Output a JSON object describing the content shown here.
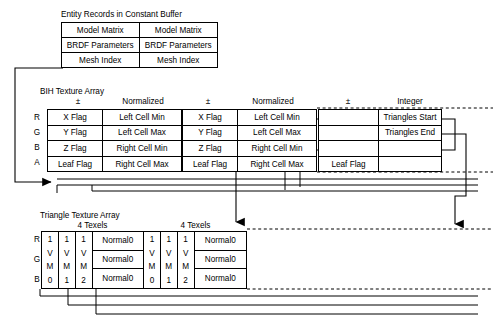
{
  "diagram": {
    "title_entity": "Entity Records in Constant Buffer",
    "title_bih": "BIH Texture Array",
    "title_tri": "Triangle Texture Array"
  },
  "entity_records": {
    "rows": [
      [
        "Model Matrix",
        "Model Matrix"
      ],
      [
        "BRDF Parameters",
        "BRDF Parameters"
      ],
      [
        "Mesh Index",
        "Mesh Index"
      ]
    ]
  },
  "bih": {
    "row_labels": [
      "R",
      "G",
      "B",
      "A"
    ],
    "headers": [
      "±",
      "Normalized",
      "±",
      "Normalized",
      "±",
      "Integer"
    ],
    "block1": {
      "rows": [
        [
          "X Flag",
          "Left Cell Min"
        ],
        [
          "Y Flag",
          "Left Cell Max"
        ],
        [
          "Z Flag",
          "Right Cell Min"
        ],
        [
          "Leaf Flag",
          "Right Cell Max"
        ]
      ]
    },
    "block2": {
      "rows": [
        [
          "X Flag",
          "Left Cell Min"
        ],
        [
          "Y Flag",
          "Left Cell Max"
        ],
        [
          "Z Flag",
          "Right Cell Min"
        ],
        [
          "Leaf Flag",
          "Right Cell Max"
        ]
      ]
    },
    "block3": {
      "rows": [
        [
          "",
          "Triangles Start"
        ],
        [
          "",
          "Triangles End"
        ],
        [
          "",
          ""
        ],
        [
          "Leaf Flag",
          ""
        ]
      ]
    }
  },
  "triangle": {
    "row_labels": [
      "R",
      "G",
      "B"
    ],
    "group_header": "4 Texels",
    "groups": [
      {
        "narrow": [
          [
            "1",
            "V",
            "M",
            "0"
          ],
          [
            "1",
            "V",
            "M",
            "1"
          ],
          [
            "1",
            "V",
            "M",
            "2"
          ]
        ],
        "wide": [
          "Normal0",
          "Normal0",
          "Normal0"
        ]
      },
      {
        "narrow": [
          [
            "1",
            "V",
            "M",
            "0"
          ],
          [
            "1",
            "V",
            "M",
            "1"
          ],
          [
            "1",
            "V",
            "M",
            "2"
          ]
        ],
        "wide": [
          "Normal0",
          "Normal0",
          "Normal0"
        ]
      }
    ]
  },
  "style": {
    "line_color": "#000000",
    "background": "#ffffff"
  }
}
